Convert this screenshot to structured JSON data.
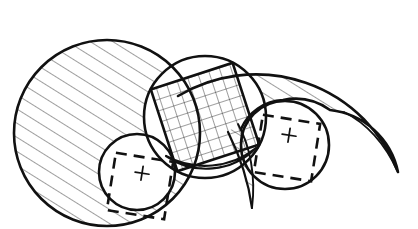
{
  "figure": {
    "background_color": "#ffffff",
    "ink_color": "#111111",
    "hatch_color": "#1a1a1a",
    "width": 418,
    "height": 229,
    "style": "hand-drawn technical line art"
  },
  "shapes": {
    "left_circle": {
      "name": "large-left-circle",
      "fill_pattern": "single-hatch",
      "cx": 107,
      "cy": 133,
      "r": 93
    },
    "right_crescent": {
      "name": "large-right-crescent",
      "fill_pattern": "single-hatch",
      "outer_cx": 268,
      "outer_cy": 167,
      "outer_r": 152,
      "scallop_arcs": 2
    },
    "center_circle": {
      "name": "center-circle",
      "fill_pattern": "none",
      "cx": 205,
      "cy": 117,
      "r": 61
    },
    "inscribed_square": {
      "name": "inscribed-rotated-square",
      "fill_pattern": "cross-hatch",
      "rotation_deg": -18,
      "side": 86,
      "cx": 205,
      "cy": 117
    },
    "lens_region": {
      "name": "lens-hatched-region",
      "fill_pattern": "single-hatch"
    },
    "small_left_circle": {
      "name": "small-left-circle",
      "fill_pattern": "none",
      "cx": 137,
      "cy": 172,
      "r": 38
    },
    "small_right_circle": {
      "name": "small-right-circle",
      "fill_pattern": "none",
      "cx": 285,
      "cy": 145,
      "r": 44
    },
    "sliver_crescent": {
      "name": "thin-sliver-crescent",
      "fill_pattern": "single-hatch"
    }
  },
  "markers": {
    "left_marker": {
      "name": "left-dashed-square",
      "label": "+",
      "rotation_deg": 9,
      "cx": 140,
      "cy": 186,
      "side": 58
    },
    "right_marker": {
      "name": "right-dashed-square",
      "label": "+",
      "rotation_deg": 9,
      "cx": 287,
      "cy": 148,
      "side": 58
    }
  }
}
